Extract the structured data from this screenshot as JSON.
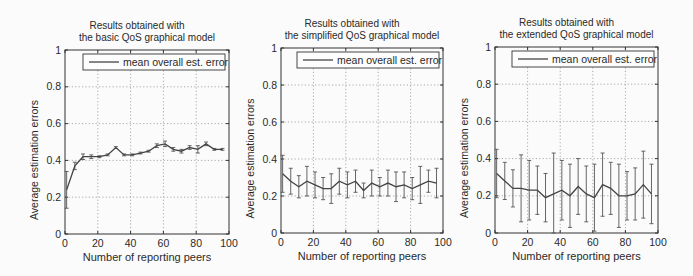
{
  "chart_data": [
    {
      "type": "line",
      "title": "Results obtained with\nthe basic QoS graphical model",
      "title_lines": [
        "Results obtained with",
        "the basic QoS graphical model"
      ],
      "xlabel": "Number of reporting peers",
      "ylabel": "Average estimation errors",
      "xlim": [
        0,
        100
      ],
      "ylim": [
        0,
        1
      ],
      "xticks": [
        "0",
        "20",
        "40",
        "60",
        "80",
        "100"
      ],
      "yticks": [
        "0",
        "0.2",
        "0.4",
        "0.6",
        "0.8",
        "1"
      ],
      "grid": true,
      "legend": {
        "position": "upper right",
        "entries": [
          "mean overall est. error"
        ]
      },
      "series": [
        {
          "name": "mean overall est. error",
          "x": [
            1,
            6,
            11,
            16,
            21,
            26,
            31,
            36,
            41,
            46,
            51,
            56,
            61,
            66,
            71,
            76,
            81,
            86,
            91,
            96
          ],
          "y": [
            0.24,
            0.37,
            0.42,
            0.42,
            0.42,
            0.43,
            0.47,
            0.43,
            0.43,
            0.44,
            0.45,
            0.48,
            0.49,
            0.46,
            0.45,
            0.47,
            0.46,
            0.49,
            0.46,
            0.46
          ],
          "err": [
            0.1,
            0.02,
            0.015,
            0.01,
            0.005,
            0.005,
            0.005,
            0.005,
            0.005,
            0.005,
            0.005,
            0.01,
            0.015,
            0.01,
            0.01,
            0.01,
            0.02,
            0.01,
            0.005,
            0.005
          ]
        }
      ]
    },
    {
      "type": "line",
      "title": "Results obtained with\nthe simplified QoS graphical model",
      "title_lines": [
        "Results obtained with",
        "the simplified QoS graphical model"
      ],
      "xlabel": "Number of reporting peers",
      "ylabel": "Average estimation errors",
      "xlim": [
        0,
        100
      ],
      "ylim": [
        0,
        1
      ],
      "xticks": [
        "0",
        "20",
        "40",
        "60",
        "80",
        "100"
      ],
      "yticks": [
        "0",
        "0.2",
        "0.4",
        "0.6",
        "0.8",
        "1"
      ],
      "grid": true,
      "legend": {
        "position": "upper right",
        "entries": [
          "mean overall est. error"
        ]
      },
      "series": [
        {
          "name": "mean overall est. error",
          "x": [
            1,
            6,
            11,
            16,
            21,
            26,
            31,
            36,
            41,
            46,
            51,
            56,
            61,
            66,
            71,
            76,
            81,
            86,
            91,
            96
          ],
          "y": [
            0.32,
            0.28,
            0.25,
            0.28,
            0.26,
            0.24,
            0.24,
            0.28,
            0.26,
            0.28,
            0.23,
            0.27,
            0.25,
            0.27,
            0.25,
            0.26,
            0.24,
            0.26,
            0.28,
            0.27
          ],
          "err": [
            0.1,
            0.07,
            0.06,
            0.08,
            0.07,
            0.06,
            0.08,
            0.07,
            0.07,
            0.06,
            0.04,
            0.07,
            0.05,
            0.07,
            0.08,
            0.07,
            0.06,
            0.1,
            0.06,
            0.08
          ]
        }
      ]
    },
    {
      "type": "line",
      "title": "Results obtained with\nthe extended QoS graphical model",
      "title_lines": [
        "Results obtained with",
        "the extended QoS graphical model"
      ],
      "xlabel": "Number of reporting peers",
      "ylabel": "Average estimation errors",
      "xlim": [
        0,
        100
      ],
      "ylim": [
        0,
        1
      ],
      "xticks": [
        "0",
        "20",
        "40",
        "60",
        "80",
        "100"
      ],
      "yticks": [
        "0",
        "0.2",
        "0.4",
        "0.6",
        "0.8",
        "1"
      ],
      "grid": true,
      "legend": {
        "position": "upper right",
        "entries": [
          "mean overall est. error"
        ]
      },
      "series": [
        {
          "name": "mean overall est. error",
          "x": [
            1,
            6,
            11,
            16,
            21,
            26,
            31,
            36,
            41,
            46,
            51,
            56,
            61,
            66,
            71,
            76,
            81,
            86,
            91,
            96
          ],
          "y": [
            0.32,
            0.28,
            0.24,
            0.24,
            0.23,
            0.23,
            0.19,
            0.21,
            0.23,
            0.2,
            0.25,
            0.21,
            0.19,
            0.26,
            0.24,
            0.2,
            0.2,
            0.21,
            0.26,
            0.21
          ],
          "err": [
            0.13,
            0.1,
            0.1,
            0.18,
            0.16,
            0.13,
            0.13,
            0.22,
            0.16,
            0.17,
            0.15,
            0.15,
            0.18,
            0.17,
            0.14,
            0.17,
            0.13,
            0.14,
            0.18,
            0.16
          ]
        }
      ]
    }
  ]
}
